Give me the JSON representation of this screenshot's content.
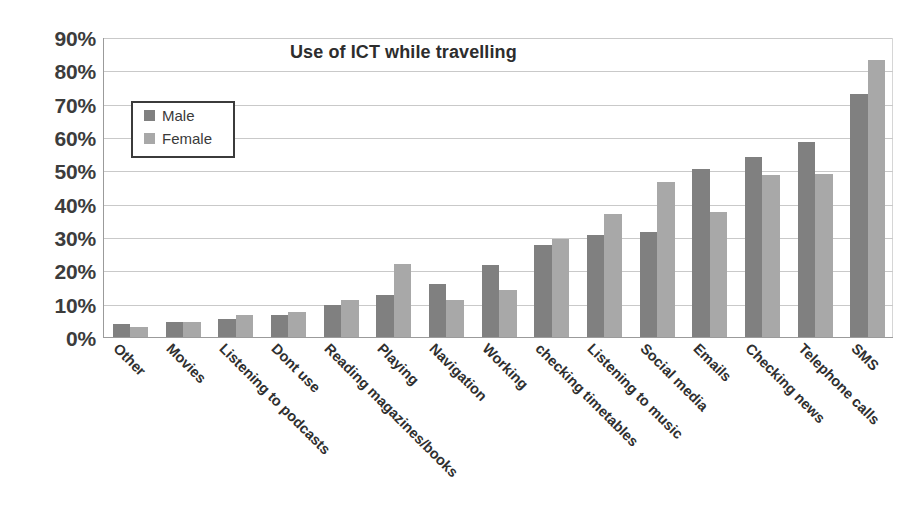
{
  "chart_data": {
    "type": "bar",
    "title": "Use of ICT while travelling",
    "xlabel": "",
    "ylabel": "",
    "ylim": [
      0,
      90
    ],
    "ytick_labels": [
      "90%",
      "80%",
      "70%",
      "60%",
      "50%",
      "40%",
      "30%",
      "20%",
      "10%",
      "0%"
    ],
    "ytick_values": [
      90,
      80,
      70,
      60,
      50,
      40,
      30,
      20,
      10,
      0
    ],
    "grid": true,
    "legend_position": "upper-left-inside",
    "categories": [
      "Other",
      "Movies",
      "Listening to podcasts",
      "Dont use",
      "Reading magazines/books",
      "Playing",
      "Navigation",
      "Working",
      "checking timetables",
      "Listening to music",
      "Social media",
      "Emails",
      "Checking news",
      "Telephone calls",
      "SMS"
    ],
    "series": [
      {
        "name": "Male",
        "color": "#808080",
        "values": [
          4.0,
          4.5,
          5.5,
          6.5,
          9.5,
          12.5,
          16.0,
          21.5,
          27.5,
          30.5,
          31.5,
          50.5,
          54.0,
          58.5,
          73.0
        ]
      },
      {
        "name": "Female",
        "color": "#a8a8a8",
        "values": [
          3.0,
          4.5,
          6.5,
          7.5,
          11.0,
          22.0,
          11.0,
          14.0,
          29.5,
          37.0,
          46.5,
          37.5,
          48.5,
          49.0,
          83.0
        ]
      }
    ],
    "axis_color": "#9b9b9b",
    "gridline_color": "#c9c9c9",
    "legend_border_color": "#3b3b3b",
    "background": "#ffffff"
  }
}
